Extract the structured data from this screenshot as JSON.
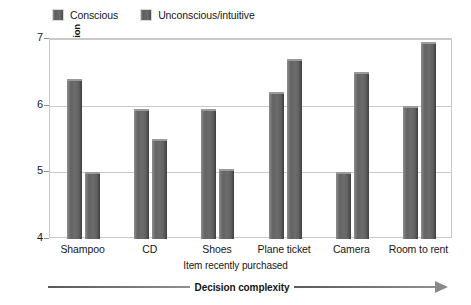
{
  "chart_data": {
    "type": "bar",
    "title": "",
    "xlabel": "Item recently purchased",
    "ylabel": "Mean rating of satisfaction",
    "categories": [
      "Shampoo",
      "CD",
      "Shoes",
      "Plane ticket",
      "Camera",
      "Room to rent"
    ],
    "series": [
      {
        "name": "Conscious",
        "values": [
          6.4,
          5.95,
          5.95,
          6.2,
          5.0,
          6.0
        ]
      },
      {
        "name": "Unconscious/intuitive",
        "values": [
          5.0,
          5.5,
          5.05,
          6.7,
          6.5,
          6.95
        ]
      }
    ],
    "ylim": [
      4,
      7
    ],
    "yticks": [
      "7",
      "6",
      "5",
      "4"
    ],
    "grid": true,
    "legend_position": "top-left",
    "annotation": "Decision complexity",
    "bar_color": "#666666"
  },
  "legend": {
    "entries": [
      {
        "label": "Conscious"
      },
      {
        "label": "Unconscious/intuitive"
      }
    ]
  },
  "axes": {
    "y_title": "Mean rating of satisfaction",
    "x_title": "Item recently purchased"
  },
  "annotation": {
    "label": "Decision complexity"
  }
}
